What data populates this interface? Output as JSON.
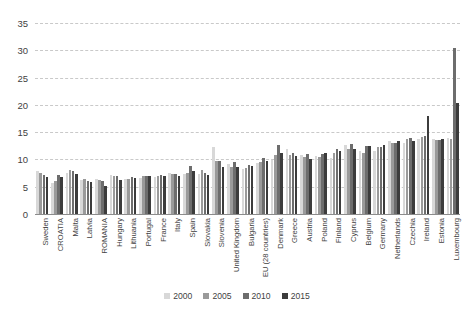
{
  "chart_data": {
    "type": "bar",
    "title": "",
    "subtitle": "",
    "xlabel": "",
    "ylabel": "",
    "ylim": [
      0,
      35
    ],
    "yticks": [
      0,
      5,
      10,
      15,
      20,
      25,
      30,
      35
    ],
    "grid": true,
    "legend_position": "bottom",
    "categories": [
      "Sweden",
      "CROATIA",
      "Malta",
      "Latvia",
      "ROMANIA",
      "Hungary",
      "Lithuania",
      "Portugal",
      "France",
      "Italy",
      "Spain",
      "Slovakia",
      "Slovenia",
      "United Kingdom",
      "Bulgaria",
      "EU (28 countries)",
      "Denmark",
      "Greece",
      "Austria",
      "Poland",
      "Finland",
      "Cyprus",
      "Belgium",
      "Germany",
      "Netherlands",
      "Czechia",
      "Ireland",
      "Estonia",
      "Luxembourg"
    ],
    "series": [
      {
        "name": "2000",
        "color": "#d8d8d8",
        "values": [
          7.9,
          5.7,
          7.5,
          6.2,
          6.5,
          7.2,
          6.5,
          6.6,
          6.8,
          7.5,
          7.4,
          7.4,
          12.2,
          9.2,
          8.2,
          9.4,
          9.9,
          12.0,
          10.8,
          10.6,
          10.3,
          12.6,
          11.5,
          11.6,
          13.4,
          13.0,
          13.8,
          13.8,
          14.0
        ]
      },
      {
        "name": "2005",
        "color": "#9a9a9a",
        "values": [
          7.5,
          6.1,
          8.0,
          6.4,
          6.3,
          7.0,
          6.4,
          6.9,
          7.0,
          7.4,
          7.6,
          8.0,
          9.8,
          8.7,
          8.5,
          9.5,
          10.9,
          10.8,
          10.4,
          10.4,
          11.2,
          11.9,
          11.2,
          12.2,
          13.0,
          13.8,
          14.1,
          13.5,
          13.8
        ]
      },
      {
        "name": "2010",
        "color": "#6d6d6d",
        "values": [
          7.2,
          7.1,
          7.8,
          6.1,
          6.1,
          7.0,
          6.8,
          7.0,
          7.2,
          7.4,
          8.8,
          7.6,
          9.7,
          9.6,
          9.0,
          10.2,
          12.6,
          11.2,
          11.0,
          11.0,
          11.9,
          12.9,
          12.5,
          12.2,
          13.0,
          14.0,
          14.3,
          13.6,
          30.5
        ]
      },
      {
        "name": "2015",
        "color": "#3c3c3c",
        "values": [
          6.8,
          6.8,
          7.3,
          5.9,
          5.2,
          6.3,
          6.6,
          7.0,
          7.0,
          7.0,
          7.8,
          7.2,
          8.6,
          8.6,
          8.8,
          9.8,
          11.2,
          10.6,
          10.0,
          11.2,
          11.5,
          12.0,
          12.4,
          12.6,
          13.3,
          13.4,
          18.0,
          13.7,
          20.3
        ]
      }
    ]
  },
  "legend": {
    "items": [
      {
        "label": "2000"
      },
      {
        "label": "2005"
      },
      {
        "label": "2010"
      },
      {
        "label": "2015"
      }
    ]
  },
  "axis": {
    "y_tick_labels": [
      "35",
      "30",
      "25",
      "20",
      "15",
      "10",
      "5",
      "0"
    ]
  }
}
